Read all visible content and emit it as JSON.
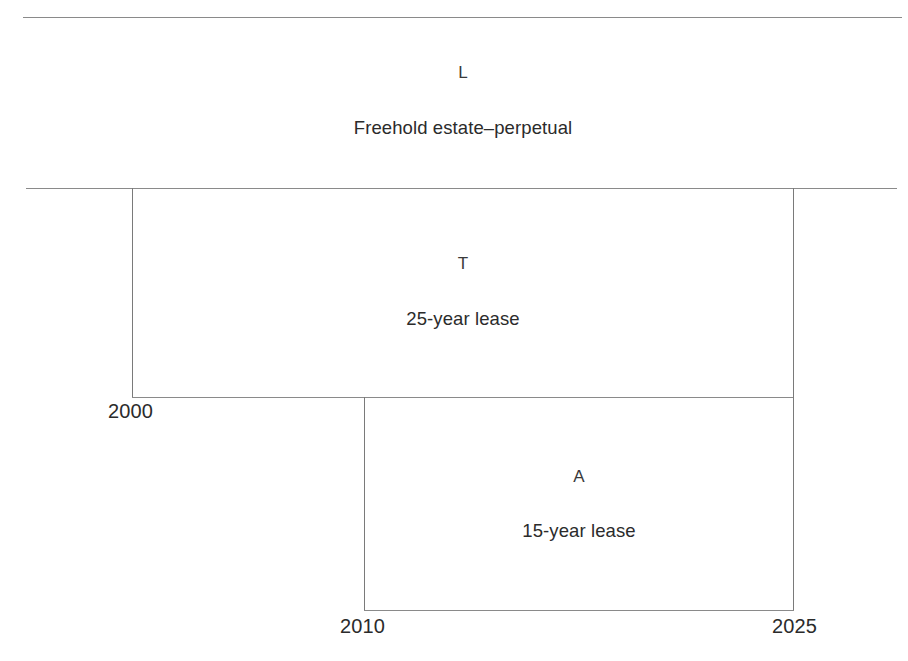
{
  "diagram": {
    "type": "lease-hierarchy-timeline",
    "title_line_present": true,
    "line_color": "#8a8a8a",
    "text_color": "#2b2b2b",
    "tiers": [
      {
        "code": "L",
        "description": "Freehold estate–perpetual",
        "span": "unbounded"
      },
      {
        "code": "T",
        "description": "25-year lease",
        "start_year": "2000",
        "end_year": "2025"
      },
      {
        "code": "A",
        "description": "15-year lease",
        "start_year": "2010",
        "end_year": "2025"
      }
    ],
    "year_markers": [
      {
        "label": "2000",
        "role": "t-lease-start"
      },
      {
        "label": "2010",
        "role": "a-lease-start"
      },
      {
        "label": "2025",
        "role": "leases-end"
      }
    ]
  }
}
